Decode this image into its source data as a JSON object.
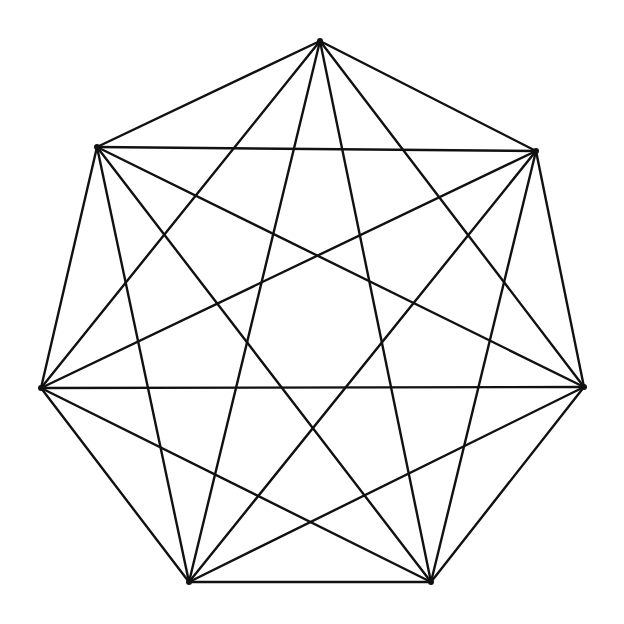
{
  "diagram": {
    "type": "complete-graph",
    "name": "K7",
    "stroke_color": "#111111",
    "background": "#ffffff",
    "vertices": [
      {
        "id": "v0",
        "x": 320,
        "y": 41
      },
      {
        "id": "v1",
        "x": 536,
        "y": 151
      },
      {
        "id": "v2",
        "x": 584,
        "y": 387
      },
      {
        "id": "v3",
        "x": 431,
        "y": 582
      },
      {
        "id": "v4",
        "x": 189,
        "y": 582
      },
      {
        "id": "v5",
        "x": 41,
        "y": 388
      },
      {
        "id": "v6",
        "x": 97,
        "y": 147
      }
    ],
    "edges": [
      [
        0,
        1
      ],
      [
        0,
        2
      ],
      [
        0,
        3
      ],
      [
        0,
        4
      ],
      [
        0,
        5
      ],
      [
        0,
        6
      ],
      [
        1,
        2
      ],
      [
        1,
        3
      ],
      [
        1,
        4
      ],
      [
        1,
        5
      ],
      [
        1,
        6
      ],
      [
        2,
        3
      ],
      [
        2,
        4
      ],
      [
        2,
        5
      ],
      [
        2,
        6
      ],
      [
        3,
        4
      ],
      [
        3,
        5
      ],
      [
        3,
        6
      ],
      [
        4,
        5
      ],
      [
        4,
        6
      ],
      [
        5,
        6
      ]
    ]
  }
}
